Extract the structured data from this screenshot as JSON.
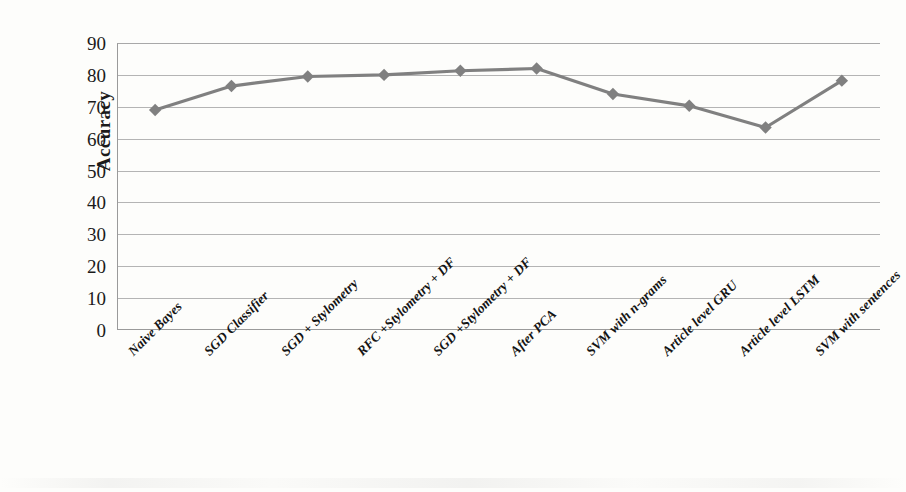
{
  "chart_data": {
    "type": "line",
    "title": "",
    "xlabel": "",
    "ylabel": "Accuracy",
    "ylim": [
      0,
      90
    ],
    "ytick_step": 10,
    "yticks": [
      90,
      80,
      70,
      60,
      50,
      40,
      30,
      20,
      10,
      0
    ],
    "grid": true,
    "legend": "none",
    "marker": "diamond",
    "series_color": "#808080",
    "grid_color": "#b4b4b4",
    "axis_color": "#9a9a9a",
    "background": "#fdfdfb",
    "categories": [
      "Naive Bayes",
      "SGD Classifier",
      "SGD + Stylometry",
      "RFC +Stylometry + DF",
      "SGD +Stylometry + DF",
      "After PCA",
      "SVM with n-grams",
      "Article level GRU",
      "Article level LSTM",
      "SVM with sentences"
    ],
    "values": [
      69.0,
      76.5,
      79.5,
      80.0,
      81.3,
      82.0,
      74.0,
      70.3,
      63.5,
      78.2
    ],
    "series": [
      {
        "name": "Accuracy",
        "values": [
          69.0,
          76.5,
          79.5,
          80.0,
          81.3,
          82.0,
          74.0,
          70.3,
          63.5,
          78.2
        ]
      }
    ]
  }
}
